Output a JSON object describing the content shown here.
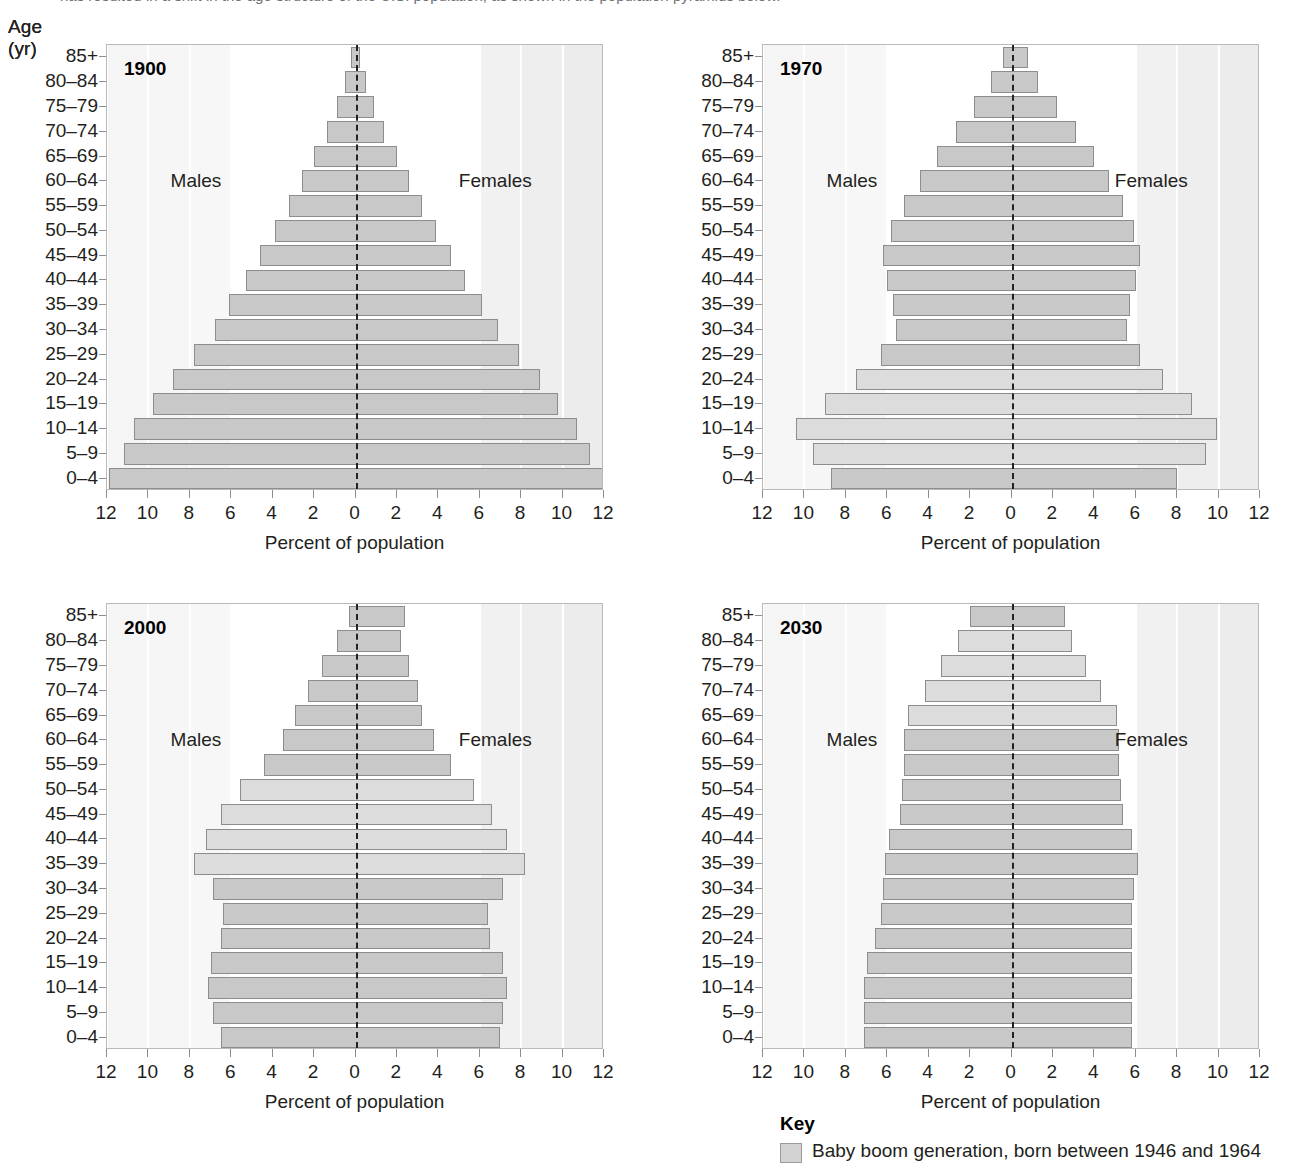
{
  "page": {
    "cut_off_text": "has resulted in a shift in the age structure of the U.S. population, as shown in the population pyramids below."
  },
  "axis": {
    "y_title": "Age (yr)",
    "x_title": "Percent of population",
    "x_ticks": [
      "12",
      "10",
      "8",
      "6",
      "4",
      "2",
      "0",
      "2",
      "4",
      "6",
      "8",
      "10",
      "12"
    ],
    "x_tick_values": [
      -12,
      -10,
      -8,
      -6,
      -4,
      -2,
      0,
      2,
      4,
      6,
      8,
      10,
      12
    ],
    "xlim": [
      -12,
      12
    ],
    "age_groups": [
      "85+",
      "80–84",
      "75–79",
      "70–74",
      "65–69",
      "60–64",
      "55–59",
      "50–54",
      "45–49",
      "40–44",
      "35–39",
      "30–34",
      "25–29",
      "20–24",
      "15–19",
      "10–14",
      "5–9",
      "0–4"
    ],
    "male_label": "Males",
    "female_label": "Females"
  },
  "key": {
    "title": "Key",
    "swatch_color": "#d3d3d3",
    "label": "Baby boom generation, born between 1946 and 1964"
  },
  "colors": {
    "bar_fill": "#c8c8c8",
    "boom_fill": "#dcdcdc",
    "bar_stroke": "#8d8d8d",
    "band_fill": "#f0f0f0",
    "midline": "#222222"
  },
  "chart_data": [
    {
      "type": "bar",
      "title": "1900",
      "subtitle": "",
      "xlabel": "Percent of population",
      "ylabel": "Age (yr)",
      "xlim": [
        -12,
        12
      ],
      "grid": false,
      "orientation": "population-pyramid",
      "categories": [
        "85+",
        "80–84",
        "75–79",
        "70–74",
        "65–69",
        "60–64",
        "55–59",
        "50–54",
        "45–49",
        "40–44",
        "35–39",
        "30–34",
        "25–29",
        "20–24",
        "15–19",
        "10–14",
        "5–9",
        "0–4"
      ],
      "series": [
        {
          "name": "Males",
          "values": [
            0.2,
            0.5,
            0.9,
            1.4,
            2.0,
            2.6,
            3.2,
            3.9,
            4.6,
            5.3,
            6.1,
            6.8,
            7.8,
            8.8,
            9.8,
            10.7,
            11.2,
            11.9
          ]
        },
        {
          "name": "Females",
          "values": [
            0.2,
            0.5,
            0.9,
            1.4,
            2.0,
            2.6,
            3.2,
            3.9,
            4.6,
            5.3,
            6.1,
            6.9,
            7.9,
            8.9,
            9.8,
            10.7,
            11.3,
            12.0
          ]
        }
      ],
      "boom_rows": []
    },
    {
      "type": "bar",
      "title": "1970",
      "subtitle": "",
      "xlabel": "Percent of population",
      "ylabel": "Age (yr)",
      "xlim": [
        -12,
        12
      ],
      "grid": false,
      "orientation": "population-pyramid",
      "categories": [
        "85+",
        "80–84",
        "75–79",
        "70–74",
        "65–69",
        "60–64",
        "55–59",
        "50–54",
        "45–49",
        "40–44",
        "35–39",
        "30–34",
        "25–29",
        "20–24",
        "15–19",
        "10–14",
        "5–9",
        "0–4"
      ],
      "series": [
        {
          "name": "Males",
          "values": [
            0.4,
            1.0,
            1.8,
            2.7,
            3.6,
            4.4,
            5.2,
            5.8,
            6.2,
            6.0,
            5.7,
            5.6,
            6.3,
            7.5,
            9.0,
            10.4,
            9.6,
            8.7
          ]
        },
        {
          "name": "Females",
          "values": [
            0.8,
            1.3,
            2.2,
            3.1,
            4.0,
            4.7,
            5.4,
            5.9,
            6.2,
            6.0,
            5.7,
            5.6,
            6.2,
            7.3,
            8.7,
            9.9,
            9.4,
            8.0
          ]
        }
      ],
      "boom_rows": [
        13,
        14,
        15,
        16
      ]
    },
    {
      "type": "bar",
      "title": "2000",
      "subtitle": "",
      "xlabel": "Percent of population",
      "ylabel": "Age (yr)",
      "xlim": [
        -12,
        12
      ],
      "grid": false,
      "orientation": "population-pyramid",
      "categories": [
        "85+",
        "80–84",
        "75–79",
        "70–74",
        "65–69",
        "60–64",
        "55–59",
        "50–54",
        "45–49",
        "40–44",
        "35–39",
        "30–34",
        "25–29",
        "20–24",
        "15–19",
        "10–14",
        "5–9",
        "0–4"
      ],
      "series": [
        {
          "name": "Males",
          "values": [
            0.3,
            0.9,
            1.6,
            2.3,
            2.9,
            3.5,
            4.4,
            5.6,
            6.5,
            7.2,
            7.8,
            6.9,
            6.4,
            6.5,
            7.0,
            7.1,
            6.9,
            6.5
          ]
        },
        {
          "name": "Females",
          "values": [
            2.4,
            2.2,
            2.6,
            3.0,
            3.2,
            3.8,
            4.6,
            5.7,
            6.6,
            7.3,
            8.2,
            7.1,
            6.4,
            6.5,
            7.1,
            7.3,
            7.1,
            7.0
          ]
        }
      ],
      "boom_rows": [
        7,
        8,
        9,
        10
      ]
    },
    {
      "type": "bar",
      "title": "2030",
      "subtitle": "",
      "xlabel": "Percent of population",
      "ylabel": "Age (yr)",
      "xlim": [
        -12,
        12
      ],
      "grid": false,
      "orientation": "population-pyramid",
      "categories": [
        "85+",
        "80–84",
        "75–79",
        "70–74",
        "65–69",
        "60–64",
        "55–59",
        "50–54",
        "45–49",
        "40–44",
        "35–39",
        "30–34",
        "25–29",
        "20–24",
        "15–19",
        "10–14",
        "5–9",
        "0–4"
      ],
      "series": [
        {
          "name": "Males",
          "values": [
            2.0,
            2.6,
            3.4,
            4.2,
            5.0,
            5.2,
            5.2,
            5.3,
            5.4,
            5.9,
            6.1,
            6.2,
            6.3,
            6.6,
            7.0,
            7.1,
            7.1,
            7.1
          ]
        },
        {
          "name": "Females",
          "values": [
            2.6,
            2.9,
            3.6,
            4.3,
            5.1,
            5.2,
            5.2,
            5.3,
            5.4,
            5.8,
            6.1,
            5.9,
            5.8,
            5.8,
            5.8,
            5.8,
            5.8,
            5.8
          ]
        }
      ],
      "boom_rows": [
        1,
        2,
        3,
        4
      ]
    }
  ]
}
